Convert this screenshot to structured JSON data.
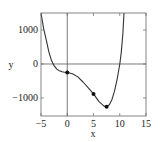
{
  "chart_data": {
    "type": "line",
    "title": "",
    "xlabel": "x",
    "ylabel": "y",
    "xlim": [
      -5,
      15
    ],
    "ylim": [
      -1530,
      1500
    ],
    "grid": false,
    "legend": null,
    "x_ticks": [
      -5,
      0,
      5,
      10,
      15
    ],
    "x_tick_labels": [
      "−5",
      "0",
      "5",
      "10",
      "15"
    ],
    "y_ticks": [
      1000,
      0,
      -1000
    ],
    "y_tick_labels": [
      "1000",
      "0",
      "−1000"
    ],
    "reference_lines": {
      "x": 0,
      "y": 0
    },
    "series": [
      {
        "name": "curve",
        "x": [
          -5,
          -4.5,
          -4,
          -3.5,
          -3,
          -2.5,
          -2,
          -1.5,
          -1,
          -0.5,
          0,
          1,
          2,
          3,
          4,
          5,
          6,
          7,
          7.5,
          8,
          8.5,
          9,
          9.5,
          10,
          10.3,
          10.6,
          10.8
        ],
        "y": [
          1500,
          1050,
          700,
          350,
          100,
          -50,
          -150,
          -200,
          -230,
          -245,
          -250,
          -290,
          -380,
          -530,
          -700,
          -880,
          -1100,
          -1240,
          -1260,
          -1200,
          -1050,
          -800,
          -450,
          0,
          350,
          900,
          1500
        ]
      }
    ],
    "markers": [
      {
        "x": 0,
        "y": -250
      },
      {
        "x": 5,
        "y": -880
      },
      {
        "x": 7.5,
        "y": -1260
      }
    ]
  }
}
